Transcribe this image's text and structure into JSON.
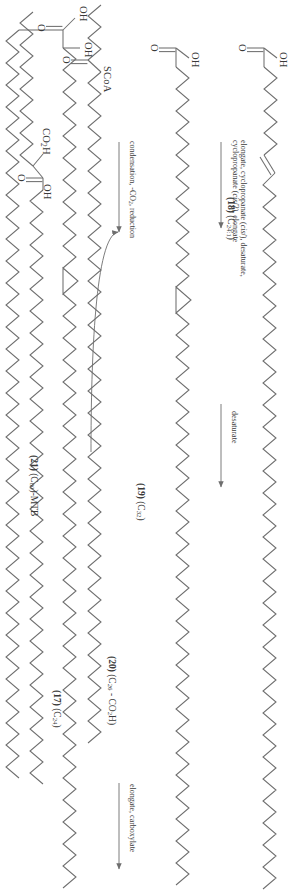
{
  "figure": {
    "kind": "chemical-reaction-scheme",
    "orientation_degrees": 90,
    "background_color": "#ffffff",
    "bond_color": "#6e6e6e",
    "text_color": "#3a3a3a"
  },
  "atom_labels": {
    "c18_oh": "OH",
    "c18_o": "O",
    "c19_oh": "OH",
    "c19_o": "O",
    "c17_scoa": "SCoA",
    "c17_o": "O",
    "c20_co2h": "CO",
    "c20_co2h_sub": "2",
    "c20_co2h_tail": "H",
    "mtb_oh_beta": "OH",
    "mtb_oh_acid": "OH",
    "mtb_o": "O",
    "meromycolate_oh": "OH",
    "meromycolate_o": "O"
  },
  "compounds": [
    {
      "id": "c17",
      "number": "(17)",
      "formula_prefix": "(C",
      "formula_sub": "24",
      "formula_suffix": ")",
      "full": "(17) (C24)",
      "terminal_group": "SCoA",
      "carbonyl": "O"
    },
    {
      "id": "c18",
      "number": "(18)",
      "formula_prefix": "(C",
      "formula_sub": "24:1",
      "formula_suffix": ")",
      "full": "(18) (C24:1)",
      "terminal_group": "OH",
      "carbonyl": "O"
    },
    {
      "id": "c19",
      "number": "(19)",
      "formula_prefix": "(C",
      "formula_sub": "32",
      "formula_suffix": ")",
      "full": "(19) (C32)",
      "terminal_group": "OH",
      "carbonyl": "O"
    },
    {
      "id": "c20",
      "number": "(20)",
      "formula_prefix": "(C",
      "formula_sub": "26",
      "formula_mid": " - CO",
      "formula_sub2": "2",
      "formula_suffix": "H)",
      "full": "(20) (C26 - CO2H)",
      "terminal_group": "CO2H",
      "carbonyl": "O"
    },
    {
      "id": "mtb",
      "number": "(21)",
      "formula_prefix": "(C",
      "formula_sub": "80",
      "formula_suffix": ")-MTB",
      "full": "(21) (C80)-MTB",
      "terminal_group": "OH",
      "carbonyl": "O"
    }
  ],
  "reactions": [
    {
      "id": "rxn-desaturate",
      "label_lines": [
        "desaturate"
      ],
      "from": "(17)",
      "to": "(18)",
      "arrow": "straight-right"
    },
    {
      "id": "rxn-elongate-cyclopropanate",
      "label_lines": [
        "elongate, cyclopropanate (cis/), desaturate,",
        "cyclopropanate (cis/2), elongate"
      ],
      "line1_plain_a": "elongate, cyclopropanate (",
      "line1_italic": "cis",
      "line1_plain_b": "/), desaturate,",
      "line2_plain_a": "cyclopropanate (",
      "line2_italic": "cis",
      "line2_plain_b": "/2), elongate",
      "from": "(18)",
      "to": "(19)",
      "arrow": "straight-right"
    },
    {
      "id": "rxn-elongate-carboxylate",
      "label_lines": [
        "elongate, carboxylate"
      ],
      "from": "(17)",
      "to": "(20)",
      "arrow": "straight-right"
    },
    {
      "id": "rxn-condensation",
      "label_lines": [
        "condensation, -CO2, reduction"
      ],
      "label_plain_a": "condensation, -CO",
      "label_sub": "2",
      "label_plain_b": ", reduction",
      "from": "(19) + (20)",
      "to": "(21)",
      "arrow": "straight-right-with-curved-feeder"
    }
  ]
}
